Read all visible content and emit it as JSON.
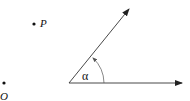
{
  "diagram": {
    "points": [
      {
        "id": "P",
        "label": "P",
        "x": 34,
        "y": 24
      },
      {
        "id": "O",
        "label": "O",
        "x": 4,
        "y": 83
      }
    ],
    "angle": {
      "label": "α",
      "vertex": {
        "x": 69,
        "y": 83
      },
      "ray1_end": {
        "x": 182,
        "y": 83
      },
      "ray2_end": {
        "x": 129,
        "y": 9
      }
    },
    "line_color": "#333333"
  }
}
